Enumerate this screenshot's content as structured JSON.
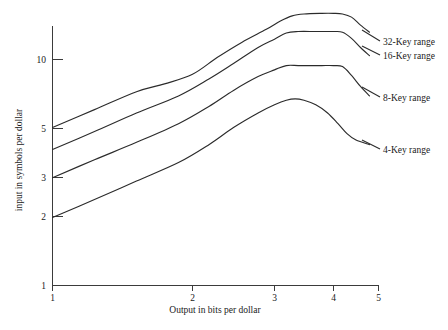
{
  "chart_data": {
    "type": "line",
    "title": "",
    "xlabel": "Output in bits per dollar",
    "ylabel": "input in symbols per dollar",
    "xscale": "linear-irregular",
    "yscale": "log",
    "xlim": [
      1,
      5
    ],
    "ylim": [
      1,
      20
    ],
    "grid": false,
    "legend_position": "right-of-plot-inline-labels",
    "xticks": [
      1,
      2,
      3,
      4,
      5
    ],
    "xtick_labels": [
      "1",
      "2",
      "3",
      "4",
      "5"
    ],
    "yticks": [
      1,
      2,
      3,
      5,
      10
    ],
    "ytick_labels": [
      "1",
      "2",
      "3",
      "5",
      "10"
    ],
    "series": [
      {
        "name": "32-Key range",
        "label": "32-Key range",
        "x": [
          1.0,
          1.3,
          1.6,
          1.8,
          2.0,
          2.3,
          2.6,
          2.9,
          3.1,
          3.3,
          3.5,
          3.8,
          4.0,
          4.2,
          4.4,
          4.6,
          4.8
        ],
        "y": [
          5.0,
          6.0,
          7.2,
          7.8,
          8.6,
          10.2,
          11.9,
          13.6,
          14.8,
          15.6,
          15.9,
          16.0,
          16.0,
          15.9,
          15.4,
          14.2,
          13.2
        ]
      },
      {
        "name": "16-Key range",
        "label": "16-Key range",
        "x": [
          1.0,
          1.3,
          1.6,
          1.9,
          2.2,
          2.5,
          2.8,
          3.0,
          3.2,
          3.4,
          3.7,
          4.0,
          4.2,
          4.4,
          4.6,
          4.8
        ],
        "y": [
          4.0,
          4.8,
          5.8,
          6.9,
          8.2,
          9.6,
          11.3,
          12.3,
          13.1,
          13.3,
          13.3,
          13.3,
          13.2,
          12.4,
          11.3,
          10.4
        ]
      },
      {
        "name": "8-Key range",
        "label": "8-Key range",
        "x": [
          1.0,
          1.3,
          1.6,
          1.9,
          2.2,
          2.5,
          2.8,
          3.0,
          3.2,
          3.4,
          3.6,
          3.8,
          4.0,
          4.2,
          4.4,
          4.6,
          4.8
        ],
        "y": [
          3.0,
          3.6,
          4.3,
          5.2,
          6.2,
          7.3,
          8.4,
          9.0,
          9.4,
          9.4,
          9.4,
          9.4,
          9.4,
          9.3,
          8.5,
          7.6,
          6.9
        ]
      },
      {
        "name": "4-Key range",
        "label": "4-Key range",
        "x": [
          1.0,
          1.3,
          1.6,
          1.9,
          2.2,
          2.5,
          2.8,
          3.0,
          3.2,
          3.35,
          3.5,
          3.7,
          3.9,
          4.1,
          4.3,
          4.5,
          4.8
        ],
        "y": [
          2.0,
          2.4,
          2.9,
          3.5,
          4.2,
          5.0,
          5.8,
          6.3,
          6.6,
          6.7,
          6.6,
          6.3,
          5.8,
          5.2,
          4.7,
          4.4,
          4.2
        ]
      }
    ],
    "annotations": [
      {
        "text": "32-Key range",
        "x_px": 383,
        "y_px": 42
      },
      {
        "text": "16-Key range",
        "x_px": 383,
        "y_px": 56
      },
      {
        "text": "8-Key range",
        "x_px": 383,
        "y_px": 98
      },
      {
        "text": "4-Key range",
        "x_px": 383,
        "y_px": 150
      }
    ]
  },
  "axes": {
    "x_title": "Output in bits per dollar",
    "y_title": "input in symbols per dollar",
    "x_tick_labels": [
      "1",
      "2",
      "3",
      "4",
      "5"
    ],
    "y_tick_labels": [
      "10",
      "5",
      "3",
      "2",
      "1"
    ]
  }
}
